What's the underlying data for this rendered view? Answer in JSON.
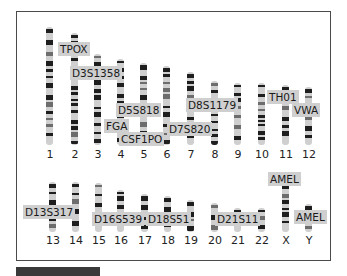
{
  "diagram": {
    "title": "",
    "frame_color": "#4a4a4a",
    "label_bg": "#cfcfcf",
    "chromosomes_row1": [
      {
        "id": "1",
        "x": 46,
        "top": 27,
        "bottom": 145
      },
      {
        "id": "2",
        "x": 71,
        "top": 33,
        "bottom": 145
      },
      {
        "id": "3",
        "x": 94,
        "top": 54,
        "bottom": 145
      },
      {
        "id": "4",
        "x": 117,
        "top": 59,
        "bottom": 145
      },
      {
        "id": "5",
        "x": 140,
        "top": 63,
        "bottom": 145
      },
      {
        "id": "6",
        "x": 163,
        "top": 66,
        "bottom": 145
      },
      {
        "id": "7",
        "x": 187,
        "top": 72,
        "bottom": 145
      },
      {
        "id": "8",
        "x": 211,
        "top": 81,
        "bottom": 145
      },
      {
        "id": "9",
        "x": 234,
        "top": 83,
        "bottom": 145
      },
      {
        "id": "10",
        "x": 258,
        "top": 83,
        "bottom": 145
      },
      {
        "id": "11",
        "x": 282,
        "top": 85,
        "bottom": 145
      },
      {
        "id": "12",
        "x": 305,
        "top": 87,
        "bottom": 145
      }
    ],
    "chromosomes_row2": [
      {
        "id": "13",
        "x": 49,
        "top": 182,
        "bottom": 232
      },
      {
        "id": "14",
        "x": 72,
        "top": 182,
        "bottom": 232
      },
      {
        "id": "15",
        "x": 95,
        "top": 183,
        "bottom": 232
      },
      {
        "id": "16",
        "x": 117,
        "top": 190,
        "bottom": 232
      },
      {
        "id": "17",
        "x": 141,
        "top": 194,
        "bottom": 232
      },
      {
        "id": "18",
        "x": 164,
        "top": 196,
        "bottom": 232
      },
      {
        "id": "19",
        "x": 187,
        "top": 200,
        "bottom": 232
      },
      {
        "id": "20",
        "x": 211,
        "top": 203,
        "bottom": 232
      },
      {
        "id": "21",
        "x": 234,
        "top": 208,
        "bottom": 232
      },
      {
        "id": "22",
        "x": 258,
        "top": 208,
        "bottom": 232
      },
      {
        "id": "X",
        "x": 282,
        "top": 182,
        "bottom": 232
      },
      {
        "id": "Y",
        "x": 305,
        "top": 204,
        "bottom": 232
      }
    ],
    "markers": [
      {
        "name": "TPOX",
        "x": 58,
        "y": 42
      },
      {
        "name": "D3S1358",
        "x": 70,
        "y": 66
      },
      {
        "name": "D5S818",
        "x": 116,
        "y": 103
      },
      {
        "name": "FGA",
        "x": 104,
        "y": 119
      },
      {
        "name": "CSF1PO",
        "x": 119,
        "y": 132
      },
      {
        "name": "D7S820",
        "x": 167,
        "y": 122
      },
      {
        "name": "D8S1179",
        "x": 186,
        "y": 98
      },
      {
        "name": "TH01",
        "x": 267,
        "y": 90
      },
      {
        "name": "VWA",
        "x": 292,
        "y": 103
      },
      {
        "name": "D13S317",
        "x": 23,
        "y": 205
      },
      {
        "name": "D16S539",
        "x": 92,
        "y": 212
      },
      {
        "name": "D18S51",
        "x": 146,
        "y": 212
      },
      {
        "name": "D21S11",
        "x": 215,
        "y": 212
      },
      {
        "name": "AMEL",
        "x": 268,
        "y": 172
      },
      {
        "name": "AMEL",
        "x": 294,
        "y": 210
      }
    ]
  }
}
